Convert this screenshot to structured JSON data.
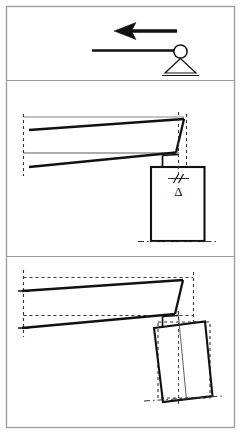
{
  "figure": {
    "width": 241,
    "height": 434,
    "background_color": "#ffffff",
    "line_color": "#111111",
    "frame_color": "#9a9a9a",
    "reference_line_color": "#4a4a4a"
  },
  "frame": {
    "outer_border": {
      "x": 6,
      "y": 6,
      "width": 229,
      "height": 422
    },
    "dividers": [
      {
        "name": "divider-top-middle",
        "y": 80
      },
      {
        "name": "divider-middle-bottom",
        "y": 256
      }
    ]
  },
  "panels": [
    {
      "id": "panel-top",
      "name": "load-and-support-panel",
      "caption": "",
      "elements": [
        {
          "name": "lateral-load-arrow",
          "type": "arrow",
          "direction": "left",
          "tail": {
            "x": 177,
            "y": 31
          },
          "head": {
            "x": 116,
            "y": 31
          },
          "stroke_width": 3.4,
          "head_length": 17,
          "head_half_height": 7.5,
          "head_notch": 4
        },
        {
          "name": "rigid-beam-line",
          "type": "line",
          "from": {
            "x": 92,
            "y": 50
          },
          "to": {
            "x": 177,
            "y": 50
          },
          "stroke_width": 2.2
        },
        {
          "name": "pin-joint-circle",
          "type": "circle",
          "cx": 180,
          "cy": 52,
          "r": 6.5,
          "stroke_width": 1.6,
          "fill": "none"
        },
        {
          "name": "triangular-support",
          "type": "triangle",
          "apex": {
            "x": 180,
            "y": 58
          },
          "left": {
            "x": 165,
            "y": 73
          },
          "right": {
            "x": 195,
            "y": 73
          },
          "stroke_width": 1.2
        },
        {
          "name": "support-ground-line",
          "type": "line",
          "from": {
            "x": 162,
            "y": 75
          },
          "to": {
            "x": 198,
            "y": 75
          },
          "stroke_width": 1.2
        }
      ]
    },
    {
      "id": "panel-middle",
      "name": "flexural-deformation-panel",
      "caption": "",
      "delta_label": "Δ",
      "elements": [
        {
          "name": "deformed-beam-top-flange",
          "type": "line",
          "from": {
            "x": 30,
            "y": 130
          },
          "to": {
            "x": 184,
            "y": 119
          },
          "stroke_width": 2.2
        },
        {
          "name": "deformed-beam-bottom-flange",
          "type": "line",
          "from": {
            "x": 30,
            "y": 167
          },
          "to": {
            "x": 176,
            "y": 152
          },
          "stroke_width": 2.2
        },
        {
          "name": "beam-right-end-web",
          "type": "line",
          "from": {
            "x": 184,
            "y": 119
          },
          "to": {
            "x": 176,
            "y": 152
          },
          "stroke_width": 2.2
        },
        {
          "name": "undeformed-axis-line",
          "type": "line",
          "from": {
            "x": 22,
            "y": 153
          },
          "to": {
            "x": 178,
            "y": 153
          },
          "stroke_width": 0.9
        },
        {
          "name": "left-end-dashed-reference",
          "type": "dashed-line",
          "from": {
            "x": 23,
            "y": 116
          },
          "to": {
            "x": 23,
            "y": 175
          },
          "stroke_width": 1.1,
          "dash": "3,3"
        },
        {
          "name": "right-end-dashed-reference",
          "type": "dashed-line",
          "from": {
            "x": 186,
            "y": 115
          },
          "to": {
            "x": 186,
            "y": 165
          },
          "stroke_width": 1.1,
          "dash": "3,3"
        },
        {
          "name": "top-reference-tick",
          "type": "line",
          "from": {
            "x": 23,
            "y": 117
          },
          "to": {
            "x": 184,
            "y": 117
          },
          "stroke_width": 0.7
        },
        {
          "name": "joint-connector-left",
          "type": "line",
          "from": {
            "x": 163,
            "y": 155
          },
          "to": {
            "x": 163,
            "y": 167
          },
          "stroke_width": 1.6
        },
        {
          "name": "joint-connector-top",
          "type": "line",
          "from": {
            "x": 163,
            "y": 155
          },
          "to": {
            "x": 178,
            "y": 154
          },
          "stroke_width": 1.6
        },
        {
          "name": "column-outline",
          "type": "rect",
          "x": 151,
          "y": 167,
          "width": 53,
          "height": 74,
          "stroke_width": 2.0,
          "fill": "none"
        },
        {
          "name": "column-centerline-dashed",
          "type": "dashed-line",
          "from": {
            "x": 178,
            "y": 113
          },
          "to": {
            "x": 178,
            "y": 178
          },
          "stroke_width": 1.0,
          "dash": "3,3"
        },
        {
          "name": "displacement-break-marks",
          "type": "double-slash",
          "center": {
            "x": 178,
            "y": 178
          },
          "stroke_width": 1.1
        },
        {
          "name": "delta-symbol",
          "type": "text",
          "x": 178,
          "y": 195,
          "value": "Δ"
        },
        {
          "name": "column-base-ground-dashdot",
          "type": "dashdot-line",
          "from": {
            "x": 139,
            "y": 241
          },
          "to": {
            "x": 216,
            "y": 241
          },
          "stroke_width": 1.0,
          "dash": "6,3,1.5,3"
        }
      ]
    },
    {
      "id": "panel-bottom",
      "name": "sway-deformation-panel",
      "caption": "",
      "elements": [
        {
          "name": "swayed-beam-top-flange",
          "type": "line",
          "from": {
            "x": 22,
            "y": 291
          },
          "to": {
            "x": 183,
            "y": 280
          },
          "stroke_width": 2.2
        },
        {
          "name": "swayed-beam-bottom-flange",
          "type": "line",
          "from": {
            "x": 22,
            "y": 328
          },
          "to": {
            "x": 175,
            "y": 314
          },
          "stroke_width": 2.2
        },
        {
          "name": "swayed-beam-right-web",
          "type": "line",
          "from": {
            "x": 183,
            "y": 280
          },
          "to": {
            "x": 175,
            "y": 314
          },
          "stroke_width": 2.2
        },
        {
          "name": "undeformed-beam-top-dashed",
          "type": "dashed-line",
          "from": {
            "x": 23,
            "y": 277
          },
          "to": {
            "x": 193,
            "y": 277
          },
          "stroke_width": 1.1,
          "dash": "3,3"
        },
        {
          "name": "undeformed-beam-bottom-dashed",
          "type": "dashed-line",
          "from": {
            "x": 23,
            "y": 315
          },
          "to": {
            "x": 193,
            "y": 315
          },
          "stroke_width": 1.1,
          "dash": "3,3"
        },
        {
          "name": "left-end-dashed-reference",
          "type": "dashed-line",
          "from": {
            "x": 23,
            "y": 272
          },
          "to": {
            "x": 23,
            "y": 336
          },
          "stroke_width": 1.1,
          "dash": "3,3"
        },
        {
          "name": "left-end-top-tick",
          "type": "line",
          "from": {
            "x": 18,
            "y": 291
          },
          "to": {
            "x": 28,
            "y": 291
          },
          "stroke_width": 1.4
        },
        {
          "name": "left-end-bottom-tick",
          "type": "line",
          "from": {
            "x": 18,
            "y": 328
          },
          "to": {
            "x": 28,
            "y": 328
          },
          "stroke_width": 1.4
        },
        {
          "name": "right-end-dashed-reference",
          "type": "dashed-line",
          "from": {
            "x": 193,
            "y": 272
          },
          "to": {
            "x": 193,
            "y": 320
          },
          "stroke_width": 1.1,
          "dash": "3,3"
        },
        {
          "name": "joint-connector-left",
          "type": "line",
          "from": {
            "x": 163,
            "y": 316
          },
          "to": {
            "x": 163,
            "y": 327
          },
          "stroke_width": 1.6
        },
        {
          "name": "joint-connector-top",
          "type": "line",
          "from": {
            "x": 163,
            "y": 316
          },
          "to": {
            "x": 178,
            "y": 315
          },
          "stroke_width": 1.6
        },
        {
          "name": "tilted-column-outline",
          "type": "polygon",
          "points": "154,327 205,322 212,396 163,401",
          "stroke_width": 2.0,
          "fill": "none"
        },
        {
          "name": "original-column-dashed-outline",
          "type": "dashed-polygon",
          "points": "157,322 210,322 210,398 157,398",
          "stroke_width": 1.1,
          "dash": "3,3"
        },
        {
          "name": "column-centerline-thin",
          "type": "line",
          "from": {
            "x": 178,
            "y": 310
          },
          "to": {
            "x": 186,
            "y": 400
          },
          "stroke_width": 0.8
        },
        {
          "name": "column-centerline-dashed-vertical",
          "type": "dashed-line",
          "from": {
            "x": 178,
            "y": 312
          },
          "to": {
            "x": 178,
            "y": 405
          },
          "stroke_width": 0.9,
          "dash": "3,3"
        },
        {
          "name": "column-base-ground-dashdot",
          "type": "dashdot-line",
          "from": {
            "x": 144,
            "y": 400
          },
          "to": {
            "x": 222,
            "y": 396
          },
          "stroke_width": 1.0,
          "dash": "6,3,1.5,3"
        }
      ]
    }
  ]
}
